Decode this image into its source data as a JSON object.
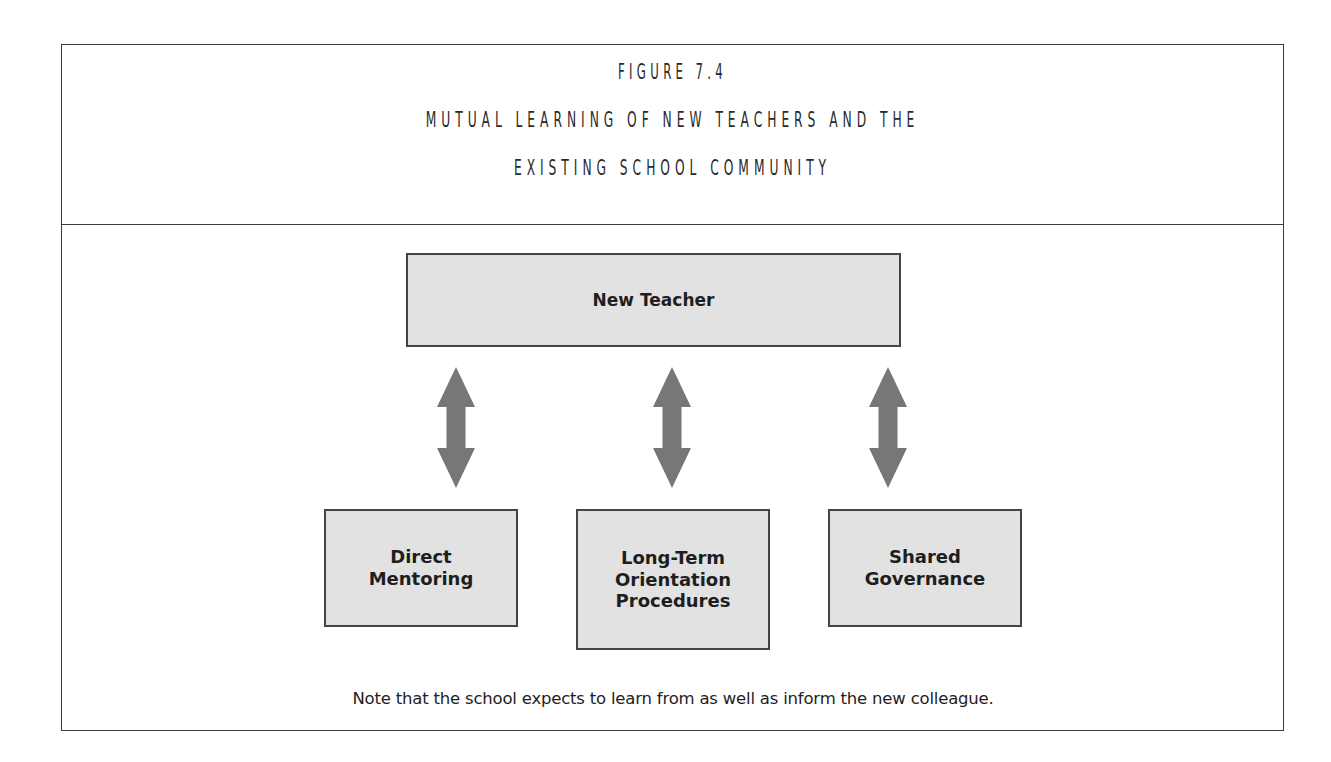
{
  "figure": {
    "number_label": "Figure 7.4",
    "title_line_1": "Mutual Learning of New Teachers and the",
    "title_line_2": "Existing School Community"
  },
  "diagram": {
    "top_node": {
      "label": "New Teacher"
    },
    "bottom_nodes": [
      {
        "label": "Direct\nMentoring"
      },
      {
        "label": "Long-Term\nOrientation\nProcedures"
      },
      {
        "label": "Shared\nGovernance"
      }
    ],
    "connectors": [
      {
        "from": "New Teacher",
        "to": "Direct Mentoring",
        "type": "bidirectional-arrow"
      },
      {
        "from": "New Teacher",
        "to": "Long-Term Orientation Procedures",
        "type": "bidirectional-arrow"
      },
      {
        "from": "New Teacher",
        "to": "Shared Governance",
        "type": "bidirectional-arrow"
      }
    ],
    "colors": {
      "box_fill": "#e2e2e2",
      "box_border": "#444444",
      "arrow_fill": "#777777",
      "frame_border": "#3c3c3c"
    }
  },
  "note": "Note that the school expects to learn from as well as inform the new colleague."
}
